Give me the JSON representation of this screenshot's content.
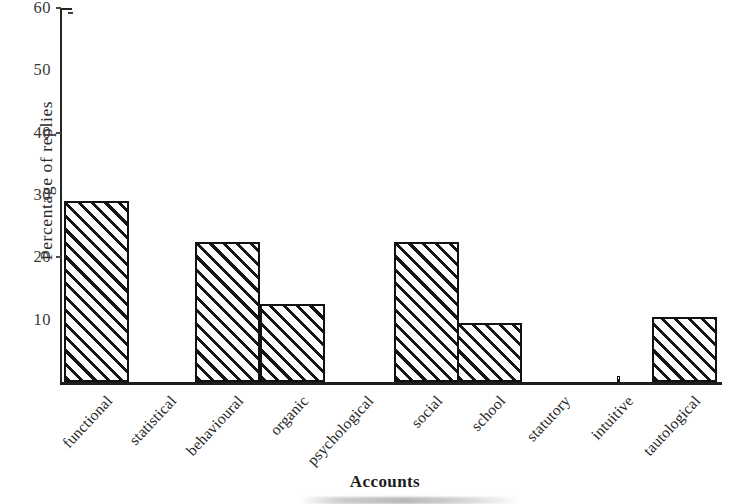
{
  "chart_data": {
    "type": "bar",
    "title": "",
    "subtitle": "",
    "xlabel": "Accounts",
    "ylabel": "Percentage of replies",
    "categories": [
      "functional",
      "statistical",
      "behavioural",
      "organic",
      "psychological",
      "social",
      "school",
      "statutory",
      "intuitive",
      "tautological"
    ],
    "values": [
      29,
      0,
      22.5,
      12.5,
      0,
      22.5,
      9.5,
      0,
      1,
      10.5
    ],
    "ylim": [
      0,
      60
    ],
    "yticks": [
      10,
      20,
      30,
      40,
      50,
      60
    ],
    "ytick_labels": [
      "10",
      "20",
      "30",
      "40",
      "50",
      "60"
    ],
    "grid": false,
    "legend": false,
    "legend_position": "none",
    "bar_style": "diagonal-hatch"
  },
  "axis": {
    "y_title": "Percentage of replies",
    "x_title": "Accounts"
  },
  "colors": {
    "ink": "#111111",
    "paper": "#ffffff",
    "hatch": "#151515",
    "axis": "#262626"
  }
}
